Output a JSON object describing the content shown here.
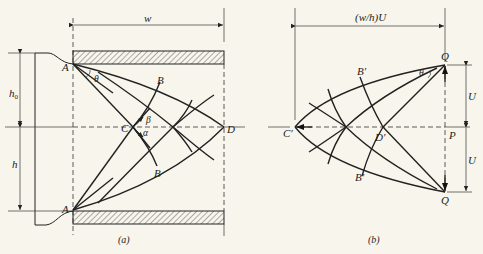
{
  "figure": {
    "panel_a": {
      "caption": "(a)",
      "dimension_width_label": "w",
      "dimension_h0_label": "h0",
      "dimension_h0_base": "h",
      "dimension_h0_sub": "0",
      "dimension_h_label": "h",
      "points": {
        "A_top": "A",
        "A_bottom": "A",
        "B_top": "B",
        "B_bottom": "B",
        "C": "C",
        "D": "D"
      },
      "angles": {
        "theta": "θ",
        "beta": "β",
        "alpha": "α"
      }
    },
    "panel_b": {
      "caption": "(b)",
      "dimension_width_label": "(w/h)U",
      "dimension_U_top": "U",
      "dimension_U_bottom": "U",
      "points": {
        "Q_top": "Q",
        "Q_bottom": "Q",
        "B_top": "B′",
        "B_bottom": "B′",
        "C": "C′",
        "D": "D′",
        "P": "P"
      },
      "angles": {
        "theta": "θ"
      }
    }
  }
}
